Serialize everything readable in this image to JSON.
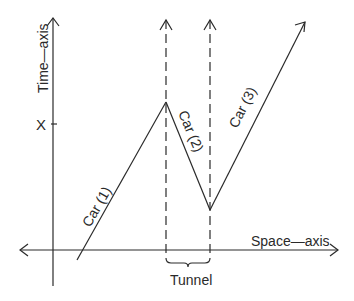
{
  "diagram": {
    "axes": {
      "time_label": "Time—axis",
      "space_label": "Space—axis",
      "tick_label": "X"
    },
    "cars": [
      {
        "label": "Car (1)"
      },
      {
        "label": "Car (2)"
      },
      {
        "label": "Car (3)"
      }
    ],
    "tunnel_label": "Tunnel",
    "colors": {
      "stroke": "#2a2a2a",
      "background": "#ffffff"
    }
  }
}
